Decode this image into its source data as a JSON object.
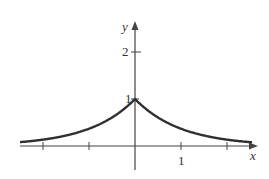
{
  "chart_data": {
    "type": "line",
    "title": "",
    "function": "y = e^(-|x|)",
    "xlabel": "x",
    "ylabel": "y",
    "xlim": [
      -2.5,
      2.7
    ],
    "ylim": [
      -0.55,
      2.6
    ],
    "x_ticks": [
      -2,
      -1,
      0,
      1,
      2
    ],
    "x_tick_labels": [
      "",
      "",
      "",
      "1",
      ""
    ],
    "y_ticks": [
      1,
      2
    ],
    "y_tick_labels": [
      "1",
      "2"
    ],
    "grid": false,
    "legend": null,
    "series": [
      {
        "name": "e^(-|x|)",
        "x": [
          -2.5,
          -2.0,
          -1.5,
          -1.0,
          -0.5,
          0.0,
          0.5,
          1.0,
          1.5,
          2.0,
          2.5
        ],
        "values": [
          0.082,
          0.135,
          0.223,
          0.368,
          0.607,
          1.0,
          0.607,
          0.368,
          0.223,
          0.135,
          0.082
        ],
        "color": "#333333"
      }
    ]
  },
  "axes": {
    "x_label": "x",
    "y_label": "y",
    "tick_label_x1": "1",
    "tick_label_y1": "1",
    "tick_label_y2": "2"
  },
  "colors": {
    "axis": "#444444",
    "curve": "#2f2f2f",
    "background": "#ffffff"
  }
}
